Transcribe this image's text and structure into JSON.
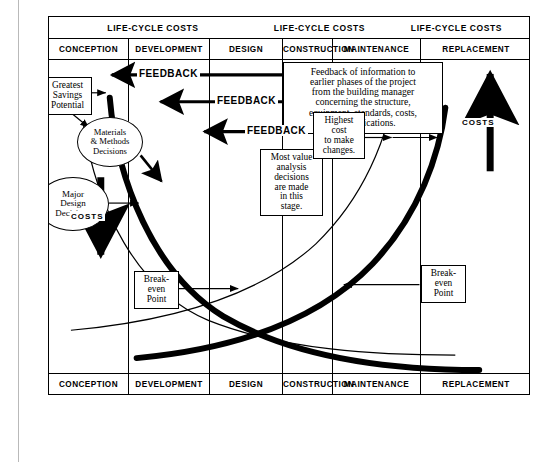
{
  "diagram": {
    "header": {
      "lifecycle_labels": [
        "LIFE-CYCLE  COSTS",
        "LIFE-CYCLE  COSTS",
        "LIFE-CYCLE COSTS"
      ],
      "phases": [
        "CONCEPTION",
        "DEVELOPMENT",
        "DESIGN",
        "CONSTRUCTION",
        "MAINTENANCE",
        "REPLACEMENT"
      ]
    },
    "footer": {
      "phases": [
        "CONCEPTION",
        "DEVELOPMENT",
        "DESIGN",
        "CONSTRUCTION",
        "MAINTENANCE",
        "REPLACEMENT"
      ]
    },
    "feedback_box": {
      "lines": [
        "Feedback of information to",
        "earlier phases of the project",
        "from the building manager",
        "concerning the structure,",
        "equipment, standards, costs,",
        "or specifications."
      ]
    },
    "feedback_arrows": [
      {
        "label": "FEEDBACK"
      },
      {
        "label": "FEEDBACK"
      },
      {
        "label": "FEEDBACK"
      }
    ],
    "callouts": {
      "greatest_savings": {
        "lines": [
          "Greatest",
          "Savings",
          "Potential"
        ]
      },
      "materials_methods": {
        "lines": [
          "Materials",
          "& Methods",
          "Decisions"
        ]
      },
      "major_design": {
        "lines": [
          "Major",
          "Design",
          "Decisions"
        ]
      },
      "most_value": {
        "lines": [
          "Most value",
          "analysis",
          "decisions",
          "are made",
          "in this",
          "stage."
        ]
      },
      "highest_cost": {
        "lines": [
          "Highest",
          "cost",
          "to make",
          "changes."
        ]
      },
      "breakeven_left": {
        "lines": [
          "Break-",
          "even",
          "Point"
        ]
      },
      "breakeven_right": {
        "lines": [
          "Break-",
          "even",
          "Point"
        ]
      }
    },
    "axis_labels": {
      "costs_down": "COSTS",
      "costs_up": "COSTS"
    },
    "colors": {
      "ink": "#000000",
      "paper": "#ffffff",
      "margin_rule": "#b9b9b9"
    }
  }
}
